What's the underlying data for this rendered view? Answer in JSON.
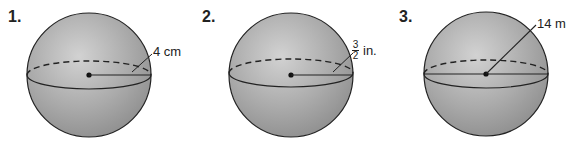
{
  "problems": [
    {
      "number": "1.",
      "radius_label": "4 cm",
      "radius_value": 4,
      "unit": "cm",
      "label_type": "radius"
    },
    {
      "number": "2.",
      "radius_numerator": "3",
      "radius_denominator": "2",
      "unit": "in.",
      "radius_value": 1.5,
      "label_type": "radius"
    },
    {
      "number": "3.",
      "radius_label": "14 m",
      "radius_value": 14,
      "unit": "m",
      "label_type": "radius"
    }
  ],
  "colors": {
    "sphere_fill": "#a9a9a9",
    "outline": "#222222",
    "background": "#ffffff"
  }
}
